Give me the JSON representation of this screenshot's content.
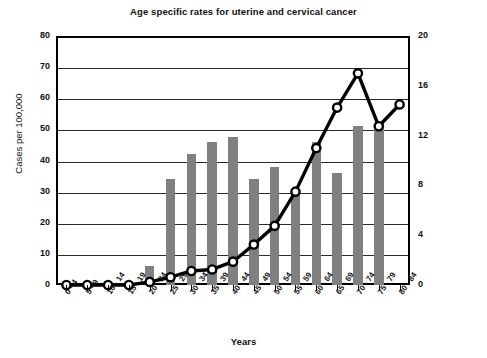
{
  "chart_data": {
    "type": "bar",
    "title": "Age specific rates for uterine and cervical cancer",
    "xlabel": "Years",
    "ylabel": "Cases per 100,000",
    "ylabel_right": "",
    "grid": true,
    "legend": "none",
    "ylim": [
      0,
      80
    ],
    "yticks": [
      0,
      10,
      20,
      30,
      40,
      50,
      60,
      70,
      80
    ],
    "ylim_right": [
      0,
      20
    ],
    "yticks_right": [
      0,
      4,
      8,
      12,
      16,
      20
    ],
    "categories": [
      "0 - 4",
      "5 - 9",
      "10 - 14",
      "15 - 19",
      "20 - 24",
      "25 - 29",
      "30 - 34",
      "35 - 39",
      "40 - 44",
      "45 - 49",
      "50 - 54",
      "55 - 59",
      "60 - 64",
      "65 - 69",
      "70 - 74",
      "75 - 79",
      "80 - 84"
    ],
    "series": [
      {
        "name": "Uterine cancer",
        "type": "bar",
        "axis": "left",
        "color": "#808080",
        "values": [
          0,
          0,
          0,
          0,
          6,
          34,
          42,
          46,
          47.5,
          34,
          38,
          30,
          46,
          36,
          51,
          52,
          0
        ]
      },
      {
        "name": "Cervical cancer",
        "type": "line",
        "axis": "right",
        "color": "#000000",
        "marker": "circle-open",
        "values_right_axis": [
          0,
          0,
          0,
          0,
          0.3,
          0.6,
          1.1,
          1.2,
          1.9,
          3.2,
          4.8,
          7.5,
          11.0,
          14.3,
          17.0,
          12.8,
          14.5
        ],
        "values_left_axis": [
          0,
          0,
          0,
          0,
          1,
          2.5,
          4.5,
          5,
          7.5,
          13,
          19,
          30,
          44,
          57,
          68,
          51,
          58
        ]
      }
    ]
  }
}
